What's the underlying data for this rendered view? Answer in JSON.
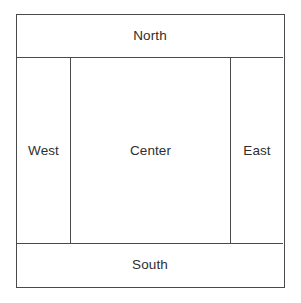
{
  "diagram": {
    "type": "border-layout",
    "background_color": "#ffffff",
    "line_color": "#4a4a4a",
    "text_color": "#2e2e2e",
    "regions": [
      {
        "id": "north",
        "label": "North",
        "position": "top"
      },
      {
        "id": "west",
        "label": "West",
        "position": "left"
      },
      {
        "id": "center",
        "label": "Center",
        "position": "middle"
      },
      {
        "id": "east",
        "label": "East",
        "position": "right"
      },
      {
        "id": "south",
        "label": "South",
        "position": "bottom"
      }
    ]
  }
}
